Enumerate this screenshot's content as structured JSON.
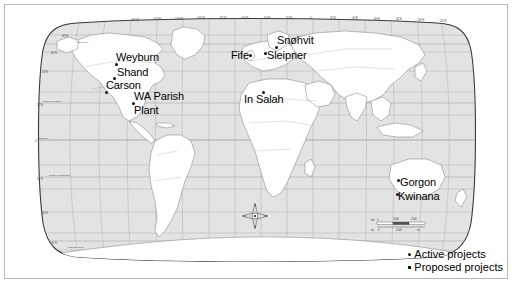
{
  "map": {
    "title": "World map of carbon capture and storage projects",
    "projection": "Robinson",
    "ocean_color": "#e3e3e3",
    "land_color": "#ffffff",
    "graticule_color": "#9d9d9d",
    "border_color": "#b9b9b9"
  },
  "longitude_labels": [
    "160°W",
    "140°W",
    "120°W",
    "100°W",
    "80°W",
    "60°W",
    "40°W",
    "20°W",
    "0°",
    "20°E",
    "40°E",
    "60°E",
    "80°E",
    "100°E",
    "120°E",
    "140°E",
    "160°E"
  ],
  "latitude_labels": [
    "80°N",
    "60°N",
    "40°N",
    "20°N",
    "0°",
    "20°S",
    "40°S",
    "60°S"
  ],
  "special_lines": [
    "Arctic Circle",
    "Tropic of Cancer",
    "Equator",
    "Tropic of Capricorn",
    "Antarctic Circle"
  ],
  "sites": [
    {
      "name": "Weyburn",
      "type": "active",
      "label_x": 111,
      "label_y": 47,
      "dot_x": 110,
      "dot_y": 58
    },
    {
      "name": "Shand",
      "type": "active",
      "label_x": 112,
      "label_y": 62,
      "dot_x": 108,
      "dot_y": 72
    },
    {
      "name": "Carson",
      "type": "active",
      "label_x": 101,
      "label_y": 75,
      "dot_x": 100,
      "dot_y": 86
    },
    {
      "name": "WA Parish",
      "type": "active",
      "label_x": 129,
      "label_y": 86,
      "dot_x": 127,
      "dot_y": 97
    },
    {
      "name": "Plant",
      "type": "active",
      "label_x": 129,
      "label_y": 100,
      "dot_x": 128,
      "dot_y": 110
    },
    {
      "name": "Fife",
      "type": "active",
      "label_x": 226,
      "label_y": 45,
      "dot_x": 244,
      "dot_y": 49
    },
    {
      "name": "Sleipner",
      "type": "active",
      "label_x": 262,
      "label_y": 45,
      "dot_x": 259,
      "dot_y": 47
    },
    {
      "name": "Snøhvit",
      "type": "active",
      "label_x": 272,
      "label_y": 30,
      "dot_x": 270,
      "dot_y": 41
    },
    {
      "name": "In Salah",
      "type": "active",
      "label_x": 239,
      "label_y": 89,
      "dot_x": 257,
      "dot_y": 86
    },
    {
      "name": "Gorgon",
      "type": "proposed",
      "label_x": 395,
      "label_y": 172,
      "dot_x": 392,
      "dot_y": 174
    },
    {
      "name": "Kwinana",
      "type": "proposed",
      "label_x": 393,
      "label_y": 186,
      "dot_x": 391,
      "dot_y": 188
    }
  ],
  "legend": {
    "items": [
      {
        "label": "Active projects",
        "marker": "dot"
      },
      {
        "label": "Proposed projects",
        "marker": "square"
      }
    ]
  },
  "scalebar": {
    "km_label": "km",
    "km_ticks": [
      "0",
      "1000",
      "2000"
    ],
    "mi_label": "mi",
    "mi_ticks": [
      "0",
      "1000",
      "mi"
    ]
  },
  "compass": {
    "name": "compass-rose",
    "x": 250,
    "y": 211
  }
}
